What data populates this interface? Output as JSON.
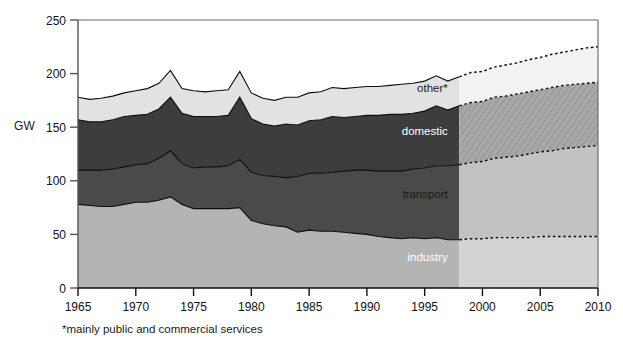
{
  "figure": {
    "footnote": "*mainly public and commercial services",
    "y_axis_title": "GW"
  },
  "chart_data": {
    "type": "area",
    "stacked": true,
    "title": "",
    "xlabel": "",
    "ylabel": "GW",
    "xlim": [
      1965,
      2010
    ],
    "ylim": [
      0,
      250
    ],
    "ytick_labels": [
      "0",
      "50",
      "100",
      "150",
      "200",
      "250"
    ],
    "yticks": [
      0,
      50,
      100,
      150,
      200,
      250
    ],
    "xtick_labels": [
      "1965",
      "1970",
      "1975",
      "1980",
      "1985",
      "1990",
      "1995",
      "2000",
      "2005",
      "2010"
    ],
    "xticks": [
      1965,
      1970,
      1975,
      1980,
      1985,
      1990,
      1995,
      2000,
      2005,
      2010
    ],
    "grid": false,
    "legend_position": "inline-annotations",
    "projection_start_year": 1998,
    "annotations": [
      {
        "label": "other*",
        "year": 1997,
        "value": 183,
        "color": "#1a1a1a"
      },
      {
        "label": "domestic",
        "year": 1997,
        "value": 143,
        "color": "#ffffff"
      },
      {
        "label": "transport",
        "year": 1997,
        "value": 84,
        "color": "#1a1a1a"
      },
      {
        "label": "industry",
        "year": 1997,
        "value": 25,
        "color": "#ffffff"
      }
    ],
    "x": [
      1965,
      1966,
      1967,
      1968,
      1969,
      1970,
      1971,
      1972,
      1973,
      1974,
      1975,
      1976,
      1977,
      1978,
      1979,
      1980,
      1981,
      1982,
      1983,
      1984,
      1985,
      1986,
      1987,
      1988,
      1989,
      1990,
      1991,
      1992,
      1993,
      1994,
      1995,
      1996,
      1997,
      1998,
      1999,
      2000,
      2001,
      2002,
      2003,
      2004,
      2005,
      2006,
      2007,
      2008,
      2009,
      2010
    ],
    "series": [
      {
        "name": "industry",
        "fill_hist": "#b4b4b4",
        "fill_proj": "#d2d2d2",
        "values": [
          78,
          77,
          76,
          76,
          78,
          80,
          80,
          82,
          85,
          78,
          74,
          74,
          74,
          74,
          75,
          63,
          60,
          58,
          57,
          52,
          54,
          53,
          53,
          52,
          51,
          50,
          48,
          47,
          46,
          47,
          46,
          47,
          45,
          45,
          46,
          46,
          47,
          47,
          47,
          47,
          48,
          48,
          48,
          48,
          48,
          48
        ]
      },
      {
        "name": "transport",
        "fill_hist": "#4a4a4a",
        "fill_proj": "#c2c2c2",
        "values": [
          32,
          33,
          34,
          35,
          35,
          35,
          36,
          39,
          43,
          38,
          38,
          39,
          39,
          40,
          45,
          45,
          45,
          46,
          46,
          52,
          53,
          54,
          55,
          57,
          59,
          60,
          61,
          62,
          63,
          64,
          66,
          67,
          69,
          70,
          71,
          72,
          74,
          75,
          76,
          78,
          79,
          80,
          82,
          83,
          84,
          85
        ]
      },
      {
        "name": "domestic",
        "fill_hist": "#3d3d3d",
        "fill_proj": "#a8a8a8",
        "hatched_proj": true,
        "values": [
          47,
          45,
          45,
          46,
          47,
          46,
          46,
          46,
          50,
          47,
          48,
          47,
          47,
          47,
          58,
          50,
          48,
          47,
          50,
          48,
          49,
          50,
          52,
          50,
          50,
          51,
          52,
          53,
          53,
          52,
          53,
          56,
          52,
          55,
          56,
          56,
          57,
          57,
          58,
          58,
          58,
          59,
          59,
          59,
          59,
          59
        ]
      },
      {
        "name": "other*",
        "fill_hist": "#e2e2e2",
        "fill_proj": "#f2f2f2",
        "values": [
          21,
          21,
          22,
          22,
          22,
          23,
          24,
          24,
          25,
          23,
          24,
          23,
          24,
          24,
          24,
          24,
          24,
          24,
          25,
          26,
          26,
          26,
          27,
          27,
          27,
          27,
          27,
          27,
          28,
          28,
          28,
          28,
          27,
          27,
          28,
          28,
          28,
          29,
          29,
          30,
          30,
          31,
          31,
          32,
          33,
          33
        ]
      }
    ],
    "totals": [
      178,
      176,
      177,
      179,
      182,
      184,
      186,
      191,
      203,
      186,
      184,
      183,
      184,
      185,
      202,
      182,
      177,
      175,
      178,
      178,
      182,
      183,
      187,
      186,
      187,
      188,
      188,
      189,
      190,
      191,
      193,
      198,
      193,
      197,
      201,
      202,
      206,
      208,
      210,
      213,
      215,
      218,
      220,
      222,
      224,
      225
    ]
  }
}
